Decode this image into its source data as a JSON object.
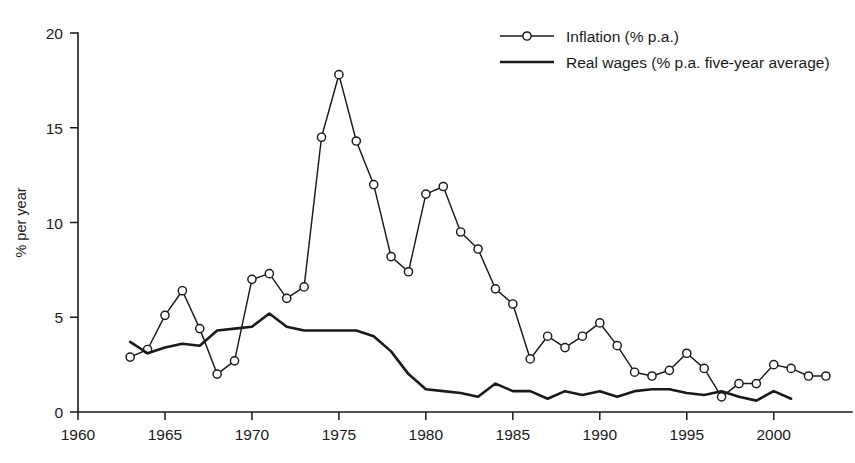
{
  "chart_data": {
    "type": "line",
    "title": "",
    "xlabel": "",
    "ylabel": "% per year",
    "xlim": [
      1960,
      2004.5
    ],
    "ylim": [
      0,
      20
    ],
    "xticks": [
      1960,
      1965,
      1970,
      1975,
      1980,
      1985,
      1990,
      1995,
      2000
    ],
    "xtick_labels": [
      "1960",
      "1965",
      "1970",
      "1975",
      "1980",
      "1985",
      "1990",
      "1995",
      "2000"
    ],
    "yticks": [
      0,
      5,
      10,
      15,
      20
    ],
    "ytick_labels": [
      "0",
      "5",
      "10",
      "15",
      "20"
    ],
    "grid": false,
    "legend_position": "top-right",
    "series": [
      {
        "name": "Inflation (% p.a.)",
        "marker": "open-circle",
        "line_width": "thin",
        "x": [
          1963,
          1964,
          1965,
          1966,
          1967,
          1968,
          1969,
          1970,
          1971,
          1972,
          1973,
          1974,
          1975,
          1976,
          1977,
          1978,
          1979,
          1980,
          1981,
          1982,
          1983,
          1984,
          1985,
          1986,
          1987,
          1988,
          1989,
          1990,
          1991,
          1992,
          1993,
          1994,
          1995,
          1996,
          1997,
          1998,
          1999,
          2000,
          2001,
          2002,
          2003
        ],
        "values": [
          2.9,
          3.3,
          5.1,
          6.4,
          4.4,
          2.0,
          2.7,
          7.0,
          7.3,
          6.0,
          6.6,
          14.5,
          17.8,
          14.3,
          12.0,
          8.2,
          7.4,
          11.5,
          11.9,
          9.5,
          8.6,
          6.5,
          5.7,
          2.8,
          4.0,
          3.4,
          4.0,
          4.7,
          3.5,
          2.1,
          1.9,
          2.2,
          3.1,
          2.3,
          0.8,
          1.5,
          1.5,
          2.5,
          2.3,
          1.9,
          1.9
        ]
      },
      {
        "name": "Real wages (% p.a. five-year average)",
        "marker": "none",
        "line_width": "thick",
        "x": [
          1963,
          1964,
          1965,
          1966,
          1967,
          1968,
          1969,
          1970,
          1971,
          1972,
          1973,
          1974,
          1975,
          1976,
          1977,
          1978,
          1979,
          1980,
          1981,
          1982,
          1983,
          1984,
          1985,
          1986,
          1987,
          1988,
          1989,
          1990,
          1991,
          1992,
          1993,
          1994,
          1995,
          1996,
          1997,
          1998,
          1999,
          2000,
          2001
        ],
        "values": [
          3.7,
          3.1,
          3.4,
          3.6,
          3.5,
          4.3,
          4.4,
          4.5,
          5.2,
          4.5,
          4.3,
          4.3,
          4.3,
          4.3,
          4.0,
          3.2,
          2.0,
          1.2,
          1.1,
          1.0,
          0.8,
          1.5,
          1.1,
          1.1,
          0.7,
          1.1,
          0.9,
          1.1,
          0.8,
          1.1,
          1.2,
          1.2,
          1.0,
          0.9,
          1.1,
          0.8,
          0.6,
          1.1,
          0.7
        ]
      }
    ]
  },
  "legend": {
    "items": [
      {
        "label": "Inflation (% p.a.)",
        "marker": "open-circle"
      },
      {
        "label": "Real wages (% p.a. five-year average)",
        "marker": "none"
      }
    ]
  },
  "colors": {
    "ink": "#1a1a1a",
    "background": "#ffffff",
    "marker_fill": "#ffffff"
  }
}
